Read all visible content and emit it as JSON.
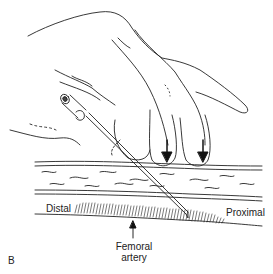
{
  "figure": {
    "panel_letter": "B",
    "labels": {
      "distal": "Distal",
      "proximal": "Proximal",
      "femoral_line1": "Femoral",
      "femoral_line2": "artery"
    }
  }
}
